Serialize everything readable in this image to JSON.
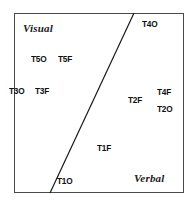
{
  "figure": {
    "frame": {
      "left": 14,
      "top": 13,
      "width": 170,
      "height": 180,
      "border_color": "#4a4a4a",
      "background": "#ffffff"
    },
    "divider": {
      "name": "discriminant-boundary-line",
      "x1": 50,
      "y1": 193,
      "x2": 134,
      "y2": 13,
      "color": "#1a1a1a",
      "width": 1.2
    },
    "region_labels": [
      {
        "text": "Visual",
        "x": 23,
        "y": 22
      },
      {
        "text": "Verbal",
        "x": 134,
        "y": 172
      }
    ],
    "point_labels": [
      {
        "text": "T4O",
        "x": 142,
        "y": 19,
        "region": "verbal"
      },
      {
        "text": "T5O",
        "x": 31,
        "y": 54,
        "region": "visual"
      },
      {
        "text": "T5F",
        "x": 58,
        "y": 54,
        "region": "visual"
      },
      {
        "text": "T3O",
        "x": 9,
        "y": 86,
        "region": "visual"
      },
      {
        "text": "T3F",
        "x": 35,
        "y": 86,
        "region": "visual"
      },
      {
        "text": "T4F",
        "x": 157,
        "y": 87,
        "region": "verbal"
      },
      {
        "text": "T2F",
        "x": 128,
        "y": 95,
        "region": "verbal"
      },
      {
        "text": "T2O",
        "x": 157,
        "y": 104,
        "region": "verbal"
      },
      {
        "text": "T1F",
        "x": 97,
        "y": 143,
        "region": "verbal"
      },
      {
        "text": "T1O",
        "x": 57,
        "y": 176,
        "region": "verbal"
      }
    ]
  },
  "chart_data": {
    "type": "scatter",
    "title": "",
    "xlabel": "",
    "ylabel": "",
    "grid": false,
    "legend": null,
    "annotations": [
      "Visual",
      "Verbal"
    ],
    "boundary_line": {
      "from": [
        50,
        193
      ],
      "to": [
        134,
        13
      ]
    },
    "points": [
      {
        "label": "T4O",
        "x": 142,
        "y": 19,
        "group": "Verbal"
      },
      {
        "label": "T5O",
        "x": 31,
        "y": 54,
        "group": "Visual"
      },
      {
        "label": "T5F",
        "x": 58,
        "y": 54,
        "group": "Visual"
      },
      {
        "label": "T3O",
        "x": 9,
        "y": 86,
        "group": "Visual"
      },
      {
        "label": "T3F",
        "x": 35,
        "y": 86,
        "group": "Visual"
      },
      {
        "label": "T4F",
        "x": 157,
        "y": 87,
        "group": "Verbal"
      },
      {
        "label": "T2F",
        "x": 128,
        "y": 95,
        "group": "Verbal"
      },
      {
        "label": "T2O",
        "x": 157,
        "y": 104,
        "group": "Verbal"
      },
      {
        "label": "T1F",
        "x": 97,
        "y": 143,
        "group": "Verbal"
      },
      {
        "label": "T1O",
        "x": 57,
        "y": 176,
        "group": "Verbal"
      }
    ]
  }
}
